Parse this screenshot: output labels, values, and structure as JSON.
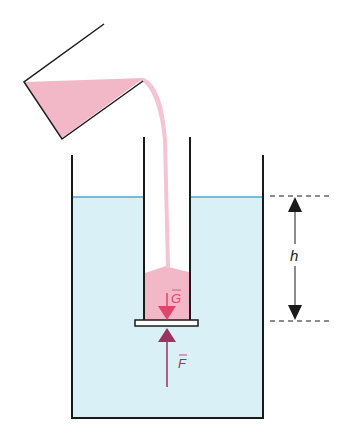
{
  "diagram": {
    "labels": {
      "weight_vector": "G",
      "force_vector": "F",
      "depth": "h"
    },
    "colors": {
      "water": "#d8f0f6",
      "water_surface": "#4aa8d8",
      "liquid": "#f2b8c8",
      "liquid_stream": "#f5c4d2",
      "arrow_G": "#e0456e",
      "arrow_F": "#a0305e",
      "outline": "#1a1a1a"
    }
  }
}
